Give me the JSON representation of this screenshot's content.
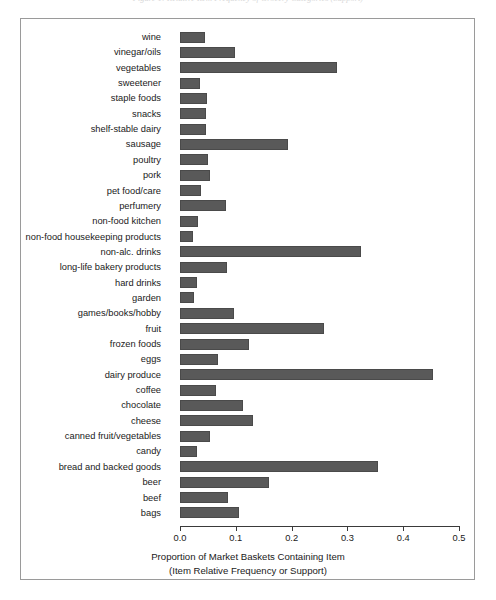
{
  "figure": {
    "top_caption": "Figure 1: Relative Item Frequency of Grocery Categories (Support)",
    "background_color": "#ffffff",
    "frame_border_color": "#9a9a9a",
    "bar_fill_color": "#595959",
    "bar_border_color": "#4a4a4a",
    "axis_color": "#3a3a3a"
  },
  "chart_data": {
    "type": "bar",
    "orientation": "horizontal",
    "title": "",
    "xlabel": "Proportion of Market Baskets Containing Item",
    "xlabel_line2": "(Item Relative Frequency or Support)",
    "ylabel": "",
    "xlim": [
      0.0,
      0.5
    ],
    "xticks": [
      0.0,
      0.1,
      0.2,
      0.3,
      0.4,
      0.5
    ],
    "xtick_labels": [
      "0.0",
      "0.1",
      "0.2",
      "0.3",
      "0.4",
      "0.5"
    ],
    "grid": false,
    "legend": false,
    "categories": [
      "wine",
      "vinegar/oils",
      "vegetables",
      "sweetener",
      "staple foods",
      "snacks",
      "shelf-stable dairy",
      "sausage",
      "poultry",
      "pork",
      "pet food/care",
      "perfumery",
      "non-food kitchen",
      "non-food housekeeping products",
      "non-alc. drinks",
      "long-life bakery products",
      "hard drinks",
      "garden",
      "games/books/hobby",
      "fruit",
      "frozen foods",
      "eggs",
      "dairy produce",
      "coffee",
      "chocolate",
      "cheese",
      "canned fruit/vegetables",
      "candy",
      "bread and backed goods",
      "beer",
      "beef",
      "bags"
    ],
    "values": [
      0.045,
      0.098,
      0.281,
      0.035,
      0.049,
      0.046,
      0.046,
      0.194,
      0.051,
      0.054,
      0.038,
      0.082,
      0.032,
      0.024,
      0.325,
      0.085,
      0.031,
      0.025,
      0.097,
      0.258,
      0.124,
      0.068,
      0.453,
      0.065,
      0.113,
      0.131,
      0.054,
      0.031,
      0.355,
      0.16,
      0.086,
      0.105
    ]
  }
}
